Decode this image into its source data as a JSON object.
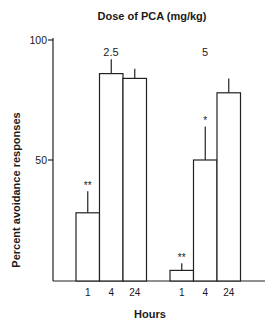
{
  "chart_data": {
    "type": "bar",
    "title": "Dose of PCA (mg/kg)",
    "xlabel": "Hours",
    "ylabel": "Percent avoidance responses",
    "ylim": [
      0,
      100
    ],
    "yticks": [
      50,
      100
    ],
    "grid": false,
    "groups": [
      {
        "label": "2.5",
        "categories": [
          "1",
          "4",
          "24"
        ],
        "values": [
          28,
          86,
          84
        ],
        "error_upper": [
          37,
          92,
          88
        ],
        "annotations": [
          "**",
          "",
          ""
        ]
      },
      {
        "label": "5",
        "categories": [
          "1",
          "4",
          "24"
        ],
        "values": [
          4,
          50,
          78
        ],
        "error_upper": [
          7,
          64,
          84
        ],
        "annotations": [
          "**",
          "*",
          ""
        ]
      }
    ]
  }
}
